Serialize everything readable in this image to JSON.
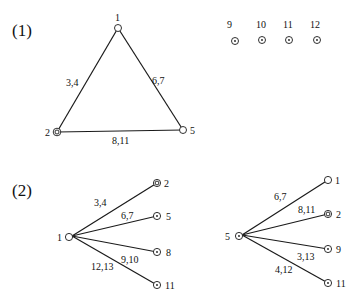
{
  "parts": [
    {
      "label": "(1)",
      "graph": {
        "nodes": [
          {
            "id": "1",
            "type": "plain"
          },
          {
            "id": "2",
            "type": "double"
          },
          {
            "id": "5",
            "type": "plain"
          }
        ],
        "edges": [
          {
            "from": "1",
            "to": "2",
            "label": "3,4"
          },
          {
            "from": "1",
            "to": "5",
            "label": "6,7"
          },
          {
            "from": "2",
            "to": "5",
            "label": "8,11"
          }
        ]
      },
      "isolated_nodes": [
        {
          "id": "9",
          "type": "dotted"
        },
        {
          "id": "10",
          "type": "dotted"
        },
        {
          "id": "11",
          "type": "dotted"
        },
        {
          "id": "12",
          "type": "dotted"
        }
      ]
    },
    {
      "label": "(2)",
      "stars": [
        {
          "center": {
            "id": "1",
            "type": "plain"
          },
          "leaves": [
            {
              "id": "2",
              "type": "double",
              "edge_label": "3,4"
            },
            {
              "id": "5",
              "type": "dotted",
              "edge_label": "6,7"
            },
            {
              "id": "8",
              "type": "dotted",
              "edge_label": "9,10"
            },
            {
              "id": "11",
              "type": "dotted",
              "edge_label": "12,13"
            }
          ]
        },
        {
          "center": {
            "id": "5",
            "type": "dotted"
          },
          "leaves": [
            {
              "id": "1",
              "type": "plain",
              "edge_label": "6,7"
            },
            {
              "id": "2",
              "type": "double",
              "edge_label": "8,11"
            },
            {
              "id": "9",
              "type": "dotted",
              "edge_label": "3,13"
            },
            {
              "id": "11",
              "type": "dotted",
              "edge_label": "4,12"
            }
          ]
        }
      ]
    }
  ]
}
